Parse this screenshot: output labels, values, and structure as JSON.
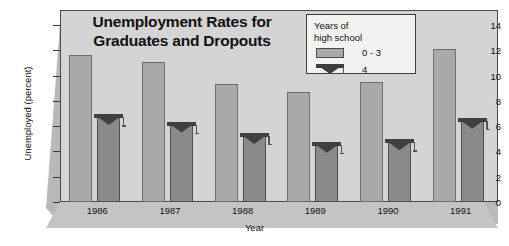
{
  "chart_data": {
    "type": "bar",
    "title": "Unemployment Rates for Graduates and Dropouts",
    "title_line1": "Unemployment Rates for",
    "title_line2": "Graduates and Dropouts",
    "xlabel": "Year",
    "ylabel": "Unemployed (percent)",
    "categories": [
      "1986",
      "1987",
      "1988",
      "1989",
      "1990",
      "1991"
    ],
    "yticks": [
      0,
      2,
      4,
      6,
      8,
      10,
      12,
      14
    ],
    "ylim": [
      0,
      15
    ],
    "grid": false,
    "legend_position": "top-right",
    "series": [
      {
        "name": "0 - 3",
        "legend_label": "0 - 3",
        "color": "#a9a9a9",
        "values": [
          11.6,
          11.1,
          9.3,
          8.7,
          9.5,
          12.1
        ]
      },
      {
        "name": "4",
        "legend_label": "4",
        "color": "#8a8a8a",
        "values": [
          6.8,
          6.2,
          5.3,
          4.6,
          4.8,
          6.5
        ]
      }
    ]
  },
  "legend": {
    "title_line1": "Years of",
    "title_line2": "high school",
    "items": [
      {
        "label": "0 - 3",
        "icon": "square-swatch-icon"
      },
      {
        "label": "4",
        "icon": "graduation-cap-icon"
      }
    ]
  },
  "axis": {
    "y_title": "Unemployed (percent)",
    "x_title": "Year",
    "y_tick_labels": [
      "0",
      "2",
      "4",
      "6",
      "8",
      "10",
      "12",
      "14"
    ],
    "x_tick_labels": [
      "1986",
      "1987",
      "1988",
      "1989",
      "1990",
      "1991"
    ]
  },
  "colors": {
    "panel": "#d4d4d4",
    "slab": "#b9b9b9",
    "bar_light": "#a9a9a9",
    "bar_dark": "#8a8a8a",
    "frame": "#4a4a4a",
    "legend_bg": "#f2f2f2"
  }
}
